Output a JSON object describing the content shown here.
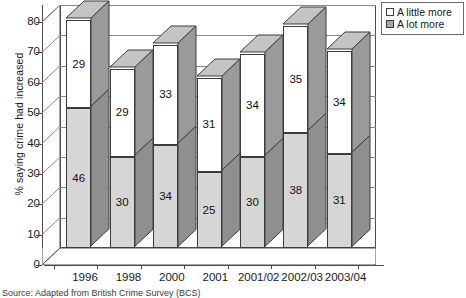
{
  "chart_data": {
    "type": "bar",
    "subtype": "stacked-3d-column",
    "title": "",
    "xlabel": "",
    "ylabel": "% saying crime had increased",
    "ylim": [
      0,
      80
    ],
    "ytick_step": 10,
    "yticks": [
      0,
      10,
      20,
      30,
      40,
      50,
      60,
      70,
      80
    ],
    "grid": true,
    "legend_position": "top-right",
    "categories": [
      "1996",
      "1998",
      "2000",
      "2001",
      "2001/02",
      "2002/03",
      "2003/04"
    ],
    "series": [
      {
        "name": "A lot more",
        "stack_position": "bottom",
        "color": "#d6d6d6",
        "values": [
          46,
          30,
          34,
          25,
          30,
          38,
          31
        ]
      },
      {
        "name": "A little more",
        "stack_position": "top",
        "color": "#ffffff",
        "values": [
          29,
          29,
          33,
          31,
          34,
          35,
          34
        ]
      }
    ],
    "totals": [
      75,
      59,
      67,
      56,
      64,
      73,
      65
    ]
  },
  "legend": {
    "items": [
      {
        "label": "A little more",
        "swatch": "white-square"
      },
      {
        "label": "A lot more",
        "swatch": "hatched-square"
      }
    ]
  },
  "axes": {
    "y": {
      "label": "% saying crime had increased",
      "ticks": [
        "80",
        "70",
        "60",
        "50",
        "40",
        "30",
        "20",
        "10",
        "0"
      ]
    },
    "x": {
      "ticks": [
        "1996",
        "1998",
        "2000",
        "2001",
        "2001/02",
        "2002/03",
        "2003/04"
      ]
    }
  },
  "source": {
    "text": "Source: Adapted from British Crime Survey (BCS)"
  },
  "colors": {
    "little_more": "#ffffff",
    "lot_more": "#d6d6d6",
    "bar_side": "#9a9a9a",
    "bar_top": "#c4c4c4",
    "outline": "#3d3d3d",
    "gridline": "#8a8a8a"
  }
}
